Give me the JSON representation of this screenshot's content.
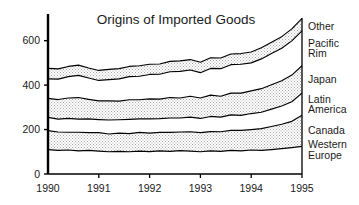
{
  "chart_data": {
    "type": "area",
    "title": "Origins of Imported Goods",
    "xlabel": "",
    "ylabel": "",
    "x": [
      1990,
      1990.2,
      1990.4,
      1990.6,
      1990.8,
      1991,
      1991.2,
      1991.4,
      1991.6,
      1991.8,
      1992,
      1992.2,
      1992.4,
      1992.6,
      1992.8,
      1993,
      1993.2,
      1993.4,
      1993.6,
      1993.8,
      1994,
      1994.2,
      1994.4,
      1994.6,
      1994.8,
      1995
    ],
    "xlim": [
      1990,
      1995
    ],
    "ylim": [
      0,
      720
    ],
    "yticks": [
      0,
      200,
      400,
      600
    ],
    "xticks": [
      1990,
      1991,
      1992,
      1993,
      1994,
      1995
    ],
    "xticklabels": [
      "1990",
      "1991",
      "1992",
      "1993",
      "1994",
      "1995"
    ],
    "yticklabels": [
      "0",
      "200",
      "400",
      "600"
    ],
    "grid": false,
    "legend_position": "right-inline",
    "stacked": true,
    "series": [
      {
        "name": "Western Europe",
        "fill": "white",
        "values": [
          110,
          106,
          108,
          104,
          106,
          103,
          100,
          102,
          100,
          103,
          101,
          104,
          102,
          105,
          103,
          100,
          104,
          102,
          106,
          104,
          108,
          106,
          110,
          114,
          119,
          124
        ]
      },
      {
        "name": "Canada",
        "fill": "gray-stipple",
        "values": [
          85,
          83,
          80,
          84,
          80,
          83,
          80,
          82,
          82,
          84,
          83,
          83,
          85,
          84,
          87,
          86,
          87,
          88,
          90,
          92,
          92,
          98,
          104,
          110,
          118,
          140
        ]
      },
      {
        "name": "Latin America",
        "fill": "white",
        "values": [
          60,
          58,
          62,
          59,
          62,
          59,
          63,
          60,
          64,
          61,
          64,
          62,
          65,
          63,
          66,
          64,
          68,
          66,
          70,
          68,
          72,
          74,
          78,
          82,
          88,
          100
        ]
      },
      {
        "name": "Japan",
        "fill": "gray-stipple",
        "values": [
          85,
          88,
          92,
          97,
          88,
          84,
          86,
          84,
          88,
          86,
          90,
          88,
          92,
          90,
          94,
          92,
          96,
          94,
          98,
          100,
          102,
          106,
          110,
          114,
          120,
          123
        ]
      },
      {
        "name": "Pacific Rim",
        "fill": "white",
        "values": [
          88,
          92,
          96,
          100,
          96,
          92,
          96,
          100,
          104,
          106,
          110,
          112,
          116,
          120,
          118,
          114,
          120,
          124,
          128,
          130,
          126,
          134,
          140,
          146,
          154,
          157
        ]
      },
      {
        "name": "Other",
        "fill": "gray-stipple",
        "values": [
          47,
          46,
          46,
          46,
          45,
          45,
          46,
          46,
          46,
          47,
          46,
          46,
          47,
          47,
          47,
          47,
          48,
          48,
          48,
          48,
          49,
          50,
          51,
          52,
          54,
          56
        ]
      }
    ],
    "cumulative_tops": {
      "Western Europe": [
        110,
        106,
        108,
        104,
        106,
        103,
        100,
        102,
        100,
        103,
        101,
        104,
        102,
        105,
        103,
        100,
        104,
        102,
        106,
        104,
        108,
        106,
        110,
        114,
        119,
        124
      ],
      "Canada": [
        195,
        189,
        188,
        188,
        186,
        186,
        180,
        184,
        182,
        187,
        184,
        187,
        187,
        189,
        190,
        186,
        191,
        190,
        196,
        196,
        200,
        204,
        214,
        224,
        237,
        264
      ],
      "Latin America": [
        255,
        247,
        250,
        247,
        248,
        245,
        243,
        244,
        246,
        248,
        248,
        249,
        252,
        252,
        256,
        250,
        259,
        256,
        266,
        264,
        272,
        278,
        292,
        306,
        325,
        364
      ],
      "Japan": [
        340,
        335,
        342,
        344,
        336,
        329,
        329,
        328,
        334,
        334,
        338,
        337,
        344,
        342,
        350,
        342,
        355,
        350,
        364,
        364,
        374,
        384,
        402,
        420,
        445,
        487
      ],
      "Pacific Rim": [
        428,
        427,
        438,
        444,
        432,
        421,
        425,
        428,
        438,
        440,
        448,
        449,
        460,
        462,
        468,
        456,
        475,
        474,
        492,
        494,
        500,
        518,
        542,
        566,
        599,
        644
      ],
      "Other": [
        475,
        473,
        484,
        490,
        477,
        466,
        471,
        474,
        484,
        487,
        494,
        495,
        507,
        509,
        515,
        503,
        523,
        522,
        540,
        542,
        549,
        568,
        593,
        618,
        653,
        700
      ]
    },
    "legend_labels": [
      {
        "name": "Other",
        "lines": [
          "Other"
        ]
      },
      {
        "name": "Pacific Rim",
        "lines": [
          "Pacific",
          "Rim"
        ]
      },
      {
        "name": "Japan",
        "lines": [
          "Japan"
        ]
      },
      {
        "name": "Latin America",
        "lines": [
          "Latin",
          "America"
        ]
      },
      {
        "name": "Canada",
        "lines": [
          "Canada"
        ]
      },
      {
        "name": "Western Europe",
        "lines": [
          "Western",
          "Europe"
        ]
      }
    ],
    "colors": {
      "line": "#000000",
      "band_shaded": "#d8d8d8",
      "band_plain": "#ffffff",
      "text": "#1a1a1a",
      "axis": "#000000"
    }
  }
}
